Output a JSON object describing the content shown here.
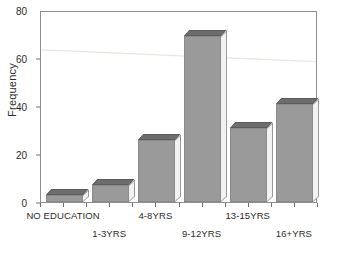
{
  "chart_data": {
    "type": "bar",
    "title": "",
    "subtitle": "",
    "xlabel": "",
    "ylabel": "Frequency",
    "categories": [
      "NO EDUCATION",
      "1-3YRS",
      "4-8YRS",
      "9-12YRS",
      "13-15YRS",
      "16+YRS"
    ],
    "values": [
      3,
      7,
      26,
      69,
      31,
      41
    ],
    "ylim": [
      0,
      80
    ],
    "yticks": [
      0,
      20,
      40,
      60,
      80
    ],
    "ytick_labels": [
      "0",
      "20",
      "40",
      "60",
      "80"
    ],
    "grid": false,
    "legend": false,
    "legend_position": "none",
    "label_rows": [
      0,
      1,
      0,
      1,
      0,
      1
    ],
    "annotations": [],
    "style": {
      "bar_face_color": "#9a9a9a",
      "bar_top_color": "#6d6d6d",
      "bar_side_color": "#f2f2f2",
      "bar_edge_color": "#8a8a8a",
      "axis_color": "#8e8e8e",
      "text_color": "#2b2b2b",
      "background": "#ffffff",
      "three_d": true
    }
  }
}
